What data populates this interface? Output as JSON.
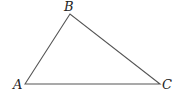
{
  "diagram": {
    "type": "triangle",
    "stroke_color": "#555555",
    "vertices": [
      {
        "label": "A",
        "x": 25,
        "y": 84
      },
      {
        "label": "B",
        "x": 70,
        "y": 14
      },
      {
        "label": "C",
        "x": 160,
        "y": 84
      }
    ],
    "labels": {
      "a": "A",
      "b": "B",
      "c": "C"
    }
  }
}
